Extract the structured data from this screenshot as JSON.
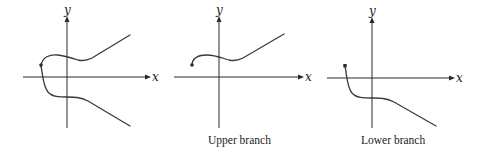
{
  "figure": {
    "panels": [
      {
        "id": "full-curve",
        "caption": "",
        "x_label": "x",
        "y_label": "y",
        "description": "Both branches with a shared endpoint on the left"
      },
      {
        "id": "upper-branch",
        "caption": "Upper branch",
        "x_label": "x",
        "y_label": "y",
        "description": "Upper branch starting at a dot left of the y-axis, dipping then rising"
      },
      {
        "id": "lower-branch",
        "caption": "Lower branch",
        "x_label": "x",
        "y_label": "y",
        "description": "Lower branch starting at a dot above the x-axis, dropping, flattening below the axis, then descending"
      }
    ]
  }
}
